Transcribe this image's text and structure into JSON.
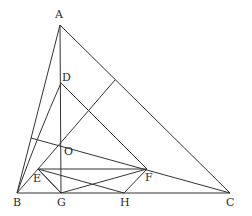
{
  "diagram": {
    "type": "geometry-figure",
    "stroke_color": "#333333",
    "points": {
      "A": {
        "label": "A",
        "x": 60,
        "y": 25,
        "lx": 55,
        "ly": 9
      },
      "D": {
        "label": "D",
        "x": 61,
        "y": 83,
        "lx": 62,
        "ly": 72
      },
      "O": {
        "label": "O",
        "x": 62,
        "y": 152,
        "lx": 64,
        "ly": 146
      },
      "E": {
        "label": "E",
        "x": 38,
        "y": 169,
        "lx": 33,
        "ly": 174
      },
      "F": {
        "label": "F",
        "x": 147,
        "y": 169,
        "lx": 145,
        "ly": 173
      },
      "B": {
        "label": "B",
        "x": 17,
        "y": 193,
        "lx": 13,
        "ly": 198
      },
      "G": {
        "label": "G",
        "x": 61,
        "y": 193,
        "lx": 57,
        "ly": 198
      },
      "H": {
        "label": "H",
        "x": 124,
        "y": 193,
        "lx": 120,
        "ly": 198
      },
      "C": {
        "label": "C",
        "x": 230,
        "y": 193,
        "lx": 226,
        "ly": 198
      }
    }
  }
}
